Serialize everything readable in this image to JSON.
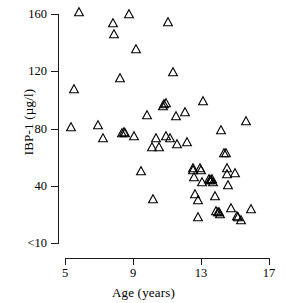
{
  "chart_data": {
    "type": "scatter",
    "title": "",
    "xlabel": "Age (years)",
    "ylabel": "IBP-1 (µg/l)",
    "xlim": [
      5,
      17
    ],
    "ylim": [
      10,
      160
    ],
    "xticks": [
      5,
      9,
      13,
      17
    ],
    "xtick_labels": [
      "5",
      "9",
      "13",
      "17"
    ],
    "yticks": [
      10,
      40,
      80,
      120,
      160
    ],
    "ytick_labels": [
      "<10",
      "40",
      "80",
      "120",
      "160"
    ],
    "grid": false,
    "legend": null,
    "marker": "open-triangle",
    "marker_color": "#000000",
    "marker_fill": "none",
    "series": [
      {
        "name": "IBP-1 vs Age",
        "points": [
          [
            5.55,
            111
          ],
          [
            5.35,
            86
          ],
          [
            5.8,
            161
          ],
          [
            6.95,
            87
          ],
          [
            7.25,
            79
          ],
          [
            7.85,
            154
          ],
          [
            7.9,
            147
          ],
          [
            8.25,
            118
          ],
          [
            8.35,
            82
          ],
          [
            8.45,
            83
          ],
          [
            8.55,
            82
          ],
          [
            8.75,
            160
          ],
          [
            9.05,
            80
          ],
          [
            9.15,
            137
          ],
          [
            9.45,
            57
          ],
          [
            9.85,
            94
          ],
          [
            10.1,
            73
          ],
          [
            10.15,
            39
          ],
          [
            10.35,
            79
          ],
          [
            10.5,
            73
          ],
          [
            10.75,
            100
          ],
          [
            10.85,
            101
          ],
          [
            10.95,
            102
          ],
          [
            10.95,
            80
          ],
          [
            11.05,
            155
          ],
          [
            11.15,
            79
          ],
          [
            11.35,
            122
          ],
          [
            11.55,
            93
          ],
          [
            11.6,
            75
          ],
          [
            12.05,
            96
          ],
          [
            12.15,
            76
          ],
          [
            12.5,
            59
          ],
          [
            12.55,
            58
          ],
          [
            12.6,
            53
          ],
          [
            12.65,
            42
          ],
          [
            12.8,
            27
          ],
          [
            12.85,
            38
          ],
          [
            12.95,
            59
          ],
          [
            13.0,
            58
          ],
          [
            13.05,
            50
          ],
          [
            13.1,
            103
          ],
          [
            13.45,
            52
          ],
          [
            13.5,
            51
          ],
          [
            13.6,
            51
          ],
          [
            13.65,
            52
          ],
          [
            13.7,
            50
          ],
          [
            13.8,
            41
          ],
          [
            13.9,
            31
          ],
          [
            14.0,
            30
          ],
          [
            14.05,
            30
          ],
          [
            14.1,
            29
          ],
          [
            14.2,
            84
          ],
          [
            14.35,
            69
          ],
          [
            14.45,
            69
          ],
          [
            14.5,
            59
          ],
          [
            14.55,
            55
          ],
          [
            14.6,
            48
          ],
          [
            14.75,
            33
          ],
          [
            15.0,
            56
          ],
          [
            15.1,
            28
          ],
          [
            15.2,
            27
          ],
          [
            15.35,
            25
          ],
          [
            15.65,
            90
          ],
          [
            15.95,
            32
          ]
        ]
      }
    ]
  },
  "axes": {
    "y_label": "IBP-1 (µg/l)",
    "x_label": "Age (years)",
    "y_ticks": [
      "160",
      "120",
      "80",
      "40",
      "<10"
    ],
    "x_ticks": [
      "5",
      "9",
      "13",
      "17"
    ]
  }
}
